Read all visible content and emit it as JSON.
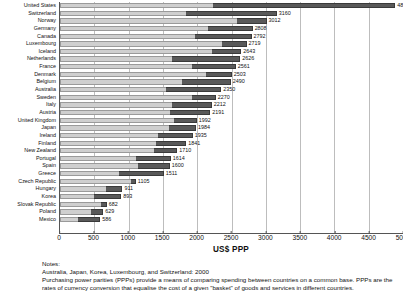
{
  "chart_data": {
    "type": "bar",
    "orientation": "horizontal",
    "stacked": true,
    "title": "",
    "xlabel": "US$ PPP",
    "ylabel": "",
    "xlim": [
      0,
      5000
    ],
    "grid": true,
    "legend_position": "none",
    "xticks": [
      0,
      500,
      1000,
      1500,
      2000,
      2500,
      3000,
      3500,
      4000,
      4500,
      5000
    ],
    "categories": [
      "United States",
      "Switzerland",
      "Norway",
      "Germany",
      "Canada",
      "Luxembourg",
      "Iceland",
      "Netherlands",
      "France",
      "Denmark",
      "Belgium",
      "Australia",
      "Sweden",
      "Italy",
      "Austria",
      "United Kingdom",
      "Japan",
      "Ireland",
      "Finland",
      "New Zealand",
      "Portugal",
      "Spain",
      "Greece",
      "Czech Republic",
      "Hungary",
      "Korea",
      "Slovak Republic",
      "Poland",
      "Mexico"
    ],
    "values": [
      4887,
      3160,
      3012,
      2808,
      2792,
      2719,
      2643,
      2626,
      2561,
      2503,
      2490,
      2350,
      2270,
      2212,
      2191,
      1992,
      1984,
      1935,
      1841,
      1710,
      1614,
      1600,
      1511,
      1105,
      911,
      893,
      682,
      629,
      586
    ],
    "series": [
      {
        "name": "Public expenditure",
        "values": [
          2224,
          1830,
          2585,
          2162,
          1963,
          2365,
          2222,
          1638,
          1929,
          2132,
          1779,
          1547,
          1929,
          1640,
          1598,
          1655,
          1586,
          1424,
          1400,
          1373,
          1114,
          1136,
          857,
          1035,
          664,
          491,
          605,
          450,
          264
        ]
      },
      {
        "name": "Private expenditure",
        "values": [
          2663,
          1330,
          427,
          646,
          829,
          354,
          421,
          988,
          632,
          371,
          711,
          803,
          341,
          572,
          593,
          337,
          398,
          511,
          441,
          337,
          500,
          464,
          654,
          70,
          247,
          402,
          77,
          179,
          322
        ]
      }
    ]
  },
  "notes": {
    "heading": "Notes:",
    "line1": "Australia, Japan, Korea, Luxembourg, and Switzerland: 2000",
    "line2": "Purchasing power parities (PPPs) provide a means of comparing spending between countries on a common base. PPPs are the rates of currency conversion that equalise the cost of a given \"basket\" of goods and services in different countries."
  }
}
